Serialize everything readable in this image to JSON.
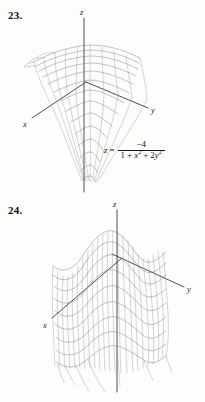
{
  "page": {
    "background_color": "#fdfdfc",
    "ink_color": "#1a1a1a"
  },
  "problems": [
    {
      "number": "23.",
      "axes": {
        "x": "x",
        "y": "y",
        "z": "z"
      },
      "equation": {
        "lhs": "z",
        "equals": "=",
        "numerator": "−4",
        "denominator_terms": [
          "1",
          "+",
          "x",
          "2",
          "+",
          "2",
          "y",
          "2"
        ],
        "plain": "z = -4 / (1 + x^2 + 2y^2)"
      },
      "surface": {
        "description": "downward funnel surface, mesh wireframe",
        "type": "surface-mesh"
      }
    },
    {
      "number": "24.",
      "axes": {
        "x": "x",
        "y": "y",
        "z": "z"
      },
      "equation": {
        "lhs": "z",
        "equals": "=",
        "terms": [
          "x",
          "2",
          "−",
          "x",
          "4",
          "−",
          "y",
          "2"
        ],
        "plain": "z = x^2 - x^4 - y^2"
      },
      "surface": {
        "description": "double-hump saddle surface, mesh wireframe",
        "type": "surface-mesh"
      }
    }
  ],
  "figure_math": {
    "eq23": {
      "z": "z",
      "eq": "=",
      "num": "−4",
      "d1": "1",
      "dplus1": "+",
      "dx": "x",
      "dxexp": "2",
      "dplus2": "+",
      "dcoef": "2",
      "dy": "y",
      "dyexp": "2"
    },
    "eq24": {
      "z": "z",
      "eq": "=",
      "t1": "x",
      "t1exp": "2",
      "minus1": "−",
      "t2": "x",
      "t2exp": "4",
      "minus2": "−",
      "t3": "y",
      "t3exp": "2"
    }
  }
}
